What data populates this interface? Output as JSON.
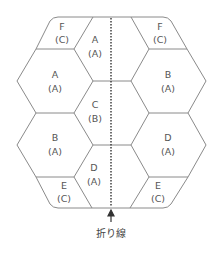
{
  "diagram": {
    "type": "hexagonal pattern layout (honeycomb panels) with fold line",
    "fold_line_label": "折り線",
    "colors": {
      "line": "#8a8a8a",
      "fold_line": "#333333",
      "text": "#555555",
      "background": "#ffffff"
    },
    "panels": [
      {
        "id": "left-top-f",
        "name": "F",
        "sub": "(C)"
      },
      {
        "id": "left-a",
        "name": "A",
        "sub": "(A)"
      },
      {
        "id": "left-b",
        "name": "B",
        "sub": "(A)"
      },
      {
        "id": "left-bottom-e",
        "name": "E",
        "sub": "(C)"
      },
      {
        "id": "mid-a",
        "name": "A",
        "sub": "(A)"
      },
      {
        "id": "mid-c",
        "name": "C",
        "sub": "(B)"
      },
      {
        "id": "mid-d",
        "name": "D",
        "sub": "(A)"
      },
      {
        "id": "right-top-f",
        "name": "F",
        "sub": "(C)"
      },
      {
        "id": "right-b",
        "name": "B",
        "sub": "(A)"
      },
      {
        "id": "right-d",
        "name": "D",
        "sub": "(A)"
      },
      {
        "id": "right-bottom-e",
        "name": "E",
        "sub": "(C)"
      }
    ]
  }
}
